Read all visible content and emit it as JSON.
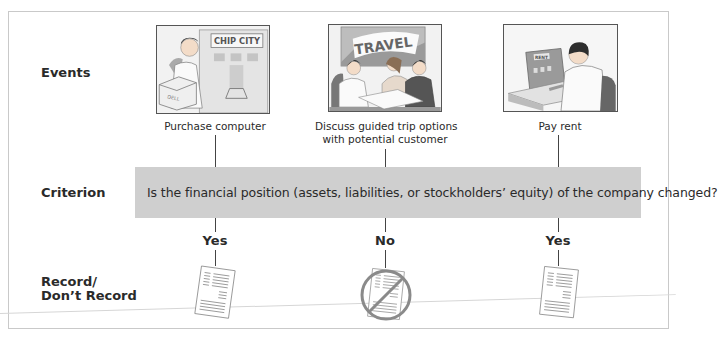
{
  "rows": {
    "events_label": "Events",
    "criterion_label": "Criterion",
    "record_label_line1": "Record/",
    "record_label_line2": "Don’t Record"
  },
  "events": [
    {
      "caption": "Purchase computer",
      "illustration": "man-carrying-dell-box-at-chip-city",
      "sign_text": "CHIP CITY",
      "box_text": "DELL",
      "answer": "Yes",
      "record": "record-document-icon"
    },
    {
      "caption_line1": "Discuss guided trip options",
      "caption_line2": "with potential customer",
      "illustration": "travel-agent-meeting",
      "sign_text": "TRAVEL",
      "answer": "No",
      "record": "no-record-prohibited-document-icon"
    },
    {
      "caption": "Pay rent",
      "illustration": "man-paying-rent-at-computer",
      "sign_text": "RENT",
      "answer": "Yes",
      "record": "record-document-icon"
    }
  ],
  "criterion": {
    "question": "Is the financial position (assets, liabilities, or stockholders’ equity) of the company changed?"
  },
  "colors": {
    "criterion_bg": "#cfcfcf",
    "prohibit_circle": "#8a8a8a",
    "border": "#c9c9c9"
  }
}
